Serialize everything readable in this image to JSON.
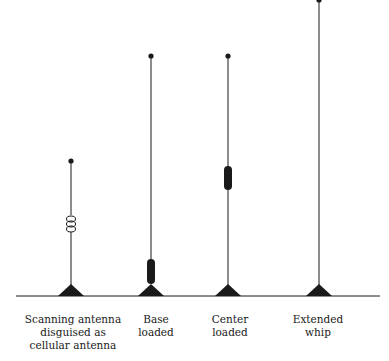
{
  "diagram": {
    "colors": {
      "ink": "#1a1a1a",
      "background": "#ffffff"
    },
    "ground_line": {
      "y": 296,
      "x1": 16,
      "x2": 380
    },
    "antennas": [
      {
        "id": "scanning",
        "x": 71,
        "top_y": 161,
        "loading": "coil",
        "label_lines": [
          "Scanning antenna",
          "disguised as",
          "cellular antenna"
        ]
      },
      {
        "id": "base-loaded",
        "x": 151,
        "top_y": 56,
        "loading": "base",
        "label_lines": [
          "Base",
          "loaded"
        ]
      },
      {
        "id": "center-loaded",
        "x": 228,
        "top_y": 56,
        "loading": "center",
        "label_lines": [
          "Center",
          "loaded"
        ]
      },
      {
        "id": "extended-whip",
        "x": 319,
        "top_y": 0,
        "loading": "none",
        "label_lines": [
          "Extended",
          "whip"
        ]
      }
    ]
  }
}
